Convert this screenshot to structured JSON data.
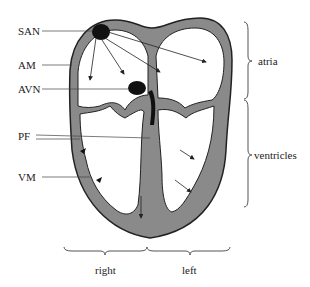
{
  "figure": {
    "labels": {
      "san": "SAN",
      "am": "AM",
      "avn": "AVN",
      "pf": "PF",
      "vm": "VM"
    },
    "groups": {
      "atria": "atria",
      "ventricles": "ventricles",
      "right": "right",
      "left": "left"
    },
    "colors": {
      "tissue": "#8a8a8a",
      "outline": "#222222",
      "node": "#111111",
      "chamber": "#ffffff"
    }
  }
}
